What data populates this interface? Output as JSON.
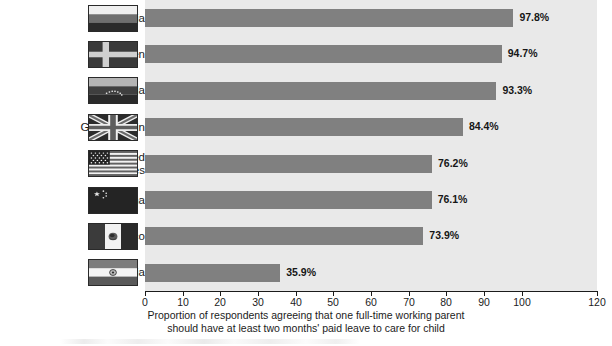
{
  "chart_data": {
    "type": "bar",
    "orientation": "horizontal",
    "title": "",
    "xlabel_lines": [
      "Proportion of respondents agreeing that one full-time working parent",
      "should have at least two months' paid leave to care for child"
    ],
    "ylabel": "",
    "categories": [
      "Russia",
      "Sweden",
      "Venezuela",
      "Great Britain",
      "United\nStates",
      "China",
      "Mexico",
      "India"
    ],
    "values": [
      97.8,
      94.7,
      93.3,
      84.4,
      76.2,
      76.1,
      73.9,
      35.9
    ],
    "value_labels": [
      "97.8%",
      "94.7%",
      "93.3%",
      "84.4%",
      "76.2%",
      "76.1%",
      "73.9%",
      "35.9%"
    ],
    "xlim": [
      0,
      120
    ],
    "xticks": [
      0,
      10,
      20,
      30,
      40,
      50,
      60,
      70,
      80,
      90,
      100,
      120
    ],
    "xtick_labels": [
      "0",
      "10",
      "20",
      "30",
      "40",
      "50",
      "60",
      "70",
      "80",
      "90",
      "100",
      "120"
    ],
    "grid": false,
    "legend": null,
    "colors": {
      "bar": "#808080",
      "plot_background": "#e9e9e9",
      "figure_background": "#ffffff",
      "axis": "#1b1b1b",
      "text": "#1b1b1b"
    },
    "flag_icons": [
      "flag-russia-icon",
      "flag-sweden-icon",
      "flag-venezuela-icon",
      "flag-great-britain-icon",
      "flag-united-states-icon",
      "flag-china-icon",
      "flag-mexico-icon",
      "flag-india-icon"
    ]
  }
}
